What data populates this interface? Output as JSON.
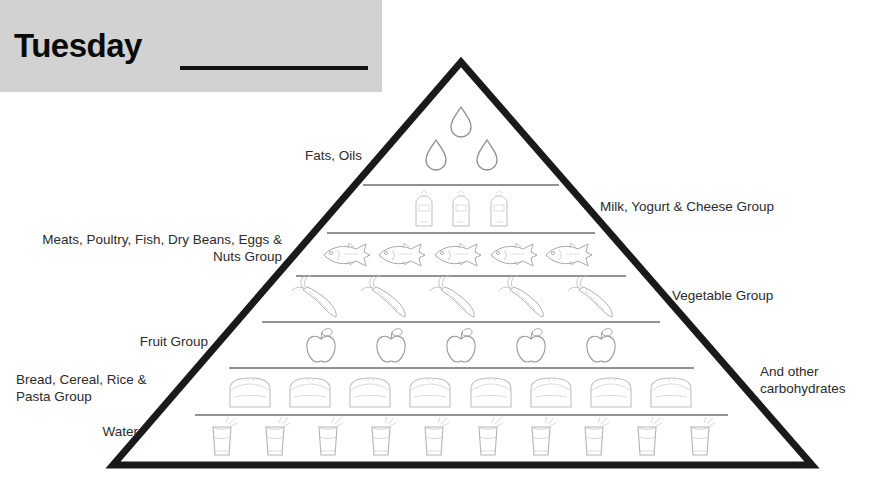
{
  "header": {
    "day_label": "Tuesday",
    "blank_line": "",
    "band_color": "#d2d2d2"
  },
  "pyramid": {
    "outline_color": "#1a1a1a",
    "divider_color": "#6e6e6e",
    "art_color": "#b9b9b9",
    "apex": {
      "x": 461,
      "y": 62
    },
    "base_left": {
      "x": 113,
      "y": 465
    },
    "base_right": {
      "x": 812,
      "y": 465
    },
    "tiers": [
      {
        "name": "fats-oils",
        "icon": "oil-droplet-icon",
        "count": 3,
        "y_top": 62,
        "y_bottom": 185
      },
      {
        "name": "milk-group",
        "icon": "milk-carton-icon",
        "count": 3,
        "y_top": 185,
        "y_bottom": 233
      },
      {
        "name": "meat-group",
        "icon": "fish-icon",
        "count": 5,
        "y_top": 233,
        "y_bottom": 276
      },
      {
        "name": "vegetable",
        "icon": "carrot-icon",
        "count": 5,
        "y_top": 276,
        "y_bottom": 322
      },
      {
        "name": "fruit",
        "icon": "apple-icon",
        "count": 5,
        "y_top": 322,
        "y_bottom": 368
      },
      {
        "name": "bread-group",
        "icon": "bread-slice-icon",
        "count": 8,
        "y_top": 368,
        "y_bottom": 415
      },
      {
        "name": "water",
        "icon": "water-glass-icon",
        "count": 10,
        "y_top": 415,
        "y_bottom": 465
      }
    ]
  },
  "labels": {
    "left": {
      "fats_oils": "Fats, Oils",
      "meats_group": "Meats, Poultry, Fish, Dry Beans, Eggs &\nNuts Group",
      "fruit_group": "Fruit Group",
      "bread_group": "Bread, Cereal, Rice &\nPasta Group",
      "water": "Water"
    },
    "right": {
      "milk_group": "Milk, Yogurt & Cheese Group",
      "vegetable_group": "Vegetable Group",
      "other_carbs": "And other\ncarbohydrates"
    }
  }
}
